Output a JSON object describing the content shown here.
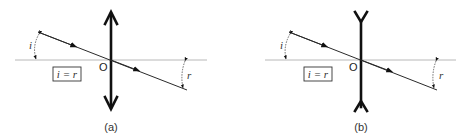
{
  "figure": {
    "panels": [
      {
        "id": "a",
        "caption": "(a)",
        "lens_type": "convex",
        "origin_label": "O",
        "incident_angle_label": "i",
        "refracted_angle_label": "r",
        "equation": "i = r"
      },
      {
        "id": "b",
        "caption": "(b)",
        "lens_type": "concave",
        "origin_label": "O",
        "incident_angle_label": "i",
        "refracted_angle_label": "r",
        "equation": "i = r"
      }
    ]
  },
  "colors": {
    "axis": "#b8b8b8",
    "ray": "#2a2a2a",
    "lens": "#111111"
  }
}
